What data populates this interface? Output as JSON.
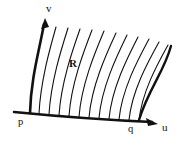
{
  "figure": {
    "kind": "hand-drawn-math-diagram",
    "background_color": "#ffffff",
    "ink_color": "#111111",
    "labels": {
      "v_axis": "v",
      "u_axis": "u",
      "region": "R",
      "left_point": "p",
      "right_point": "q"
    },
    "geometry": {
      "bold_stroke_width": 2.6,
      "thin_stroke_width": 1.1,
      "baseline": {
        "start_x": 14,
        "start_y": 112,
        "control_x": 85,
        "control_y": 119,
        "end_x": 152,
        "end_y": 122,
        "arrow_tip_x": 156,
        "arrow_tip_y": 123
      },
      "left_boundary": {
        "bottom_x": 30,
        "bottom_y": 113,
        "top_x": 44,
        "top_y": 24,
        "arrow_tip_x": 45,
        "arrow_tip_y": 19
      },
      "right_boundary": {
        "bottom_x": 139,
        "bottom_y": 120,
        "top_x": 171,
        "top_y": 46
      },
      "interior_curve_count": 11,
      "interior_curves_bottom_x": [
        39,
        49,
        59,
        69,
        79,
        89,
        99,
        109,
        119,
        129,
        139
      ],
      "interior_curves_top_x": [
        56,
        68,
        80,
        92,
        104,
        116,
        127,
        138,
        149,
        159,
        168
      ],
      "interior_curves_top_y": [
        27,
        28,
        29,
        30,
        31,
        33,
        35,
        37,
        39,
        42,
        45
      ]
    }
  }
}
